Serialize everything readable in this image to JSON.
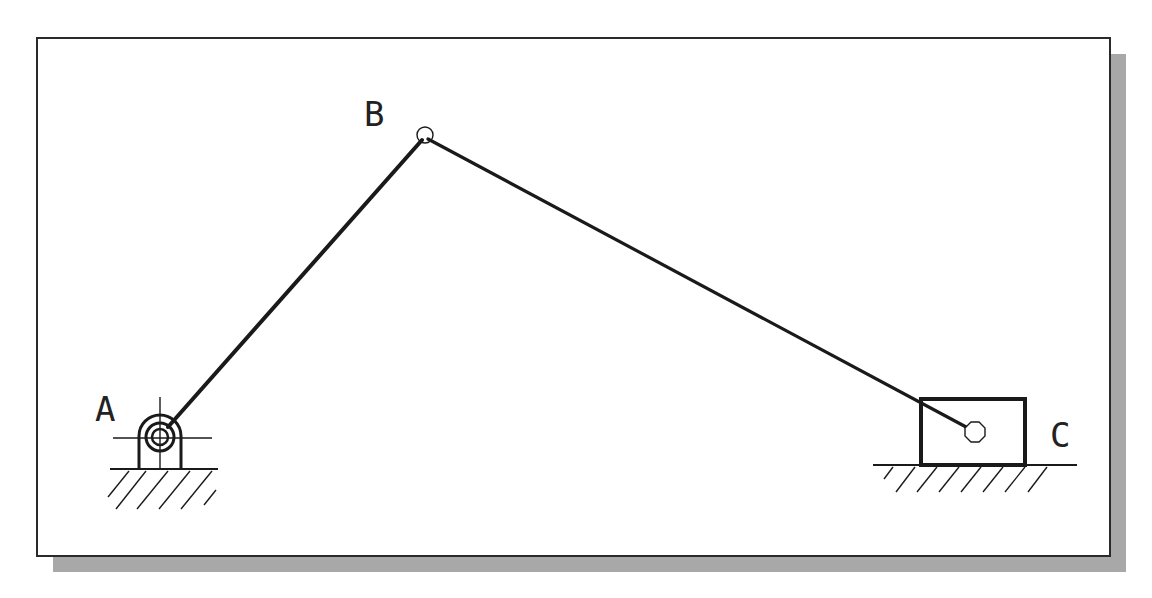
{
  "diagram": {
    "type": "slider-crank-mechanism",
    "frame": {
      "x": 37,
      "y": 38,
      "width": 1073,
      "height": 518,
      "border": "#2a2a2a",
      "shadow": "#a8a8a8",
      "shadow_offset": 16
    },
    "joints": [
      {
        "id": "A",
        "label": "A",
        "kind": "fixed-pivot",
        "x": 160,
        "y": 436,
        "label_x": 95,
        "label_y": 420
      },
      {
        "id": "B",
        "label": "B",
        "kind": "pin",
        "x": 425,
        "y": 136,
        "label_x": 364,
        "label_y": 125
      },
      {
        "id": "C",
        "label": "C",
        "kind": "slider-pin",
        "x": 975,
        "y": 432,
        "label_x": 1050,
        "label_y": 446
      }
    ],
    "links": [
      {
        "from": "A",
        "to": "B",
        "name": "crank"
      },
      {
        "from": "B",
        "to": "C",
        "name": "connecting-rod"
      }
    ],
    "slider": {
      "x": 921,
      "y": 399,
      "width": 104,
      "height": 66
    },
    "grounds": [
      {
        "name": "ground-a",
        "x1": 110,
        "x2": 218,
        "y": 469
      },
      {
        "name": "ground-c",
        "x1": 873,
        "x2": 1077,
        "y": 465
      }
    ],
    "colors": {
      "stroke": "#1a1a1a",
      "background": "#ffffff"
    }
  }
}
